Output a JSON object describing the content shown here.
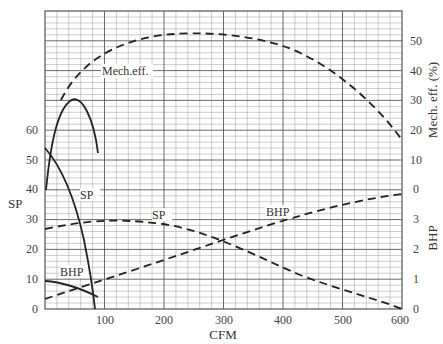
{
  "chart_data": {
    "type": "line",
    "title": "",
    "xlabel": "CFM",
    "ylabel_left": "SP",
    "ylabel_right_upper": "Mech. eff. (%)",
    "ylabel_right_lower": "BHP",
    "xlim": [
      0,
      600
    ],
    "ylim_left": [
      0,
      100
    ],
    "grid": true,
    "x_ticks": [
      "100",
      "200",
      "300",
      "400",
      "500",
      "600"
    ],
    "y_ticks_left": [
      "0",
      "10",
      "20",
      "30",
      "40",
      "50",
      "60"
    ],
    "y_ticks_right_mech_eff": [
      "0",
      "10",
      "20",
      "30",
      "40",
      "50"
    ],
    "y_ticks_right_bhp": [
      "0",
      "1",
      "2",
      "3"
    ],
    "curve_labels": {
      "mech_eff": "Mech.eff.",
      "sp_small": "SP",
      "sp_large": "SP",
      "bhp_small": "BHP",
      "bhp_large": "BHP"
    },
    "series": [
      {
        "name": "Mech.eff. (small fan, solid)",
        "style": "solid",
        "axis": "mech_eff_pct",
        "x": [
          2,
          15,
          30,
          45,
          60,
          75,
          90
        ],
        "y": [
          40,
          58,
          66,
          69,
          67,
          61,
          52
        ]
      },
      {
        "name": "SP (small fan, solid)",
        "style": "solid",
        "axis": "SP",
        "x": [
          0,
          25,
          50,
          70,
          80,
          88,
          92
        ],
        "y": [
          54,
          45,
          32,
          18,
          10,
          3,
          0
        ]
      },
      {
        "name": "BHP (small fan, solid)",
        "style": "solid",
        "axis": "BHP",
        "x": [
          0,
          25,
          50,
          75,
          90
        ],
        "y": [
          0.95,
          0.9,
          0.8,
          0.6,
          0.45
        ]
      },
      {
        "name": "Mech.eff. (large fan, dashed)",
        "style": "dashed",
        "axis": "mech_eff_pct",
        "x": [
          28,
          60,
          100,
          150,
          200,
          250,
          300,
          350,
          400,
          450,
          500,
          550,
          600
        ],
        "y": [
          32,
          40,
          46,
          50,
          51.5,
          51.5,
          50,
          47,
          42,
          36,
          29,
          20,
          10
        ]
      },
      {
        "name": "SP (large fan, dashed)",
        "style": "dashed",
        "axis": "SP",
        "x": [
          0,
          50,
          100,
          150,
          200,
          250,
          300,
          350,
          400,
          450,
          500,
          550,
          600
        ],
        "y": [
          27,
          29,
          29.5,
          29,
          27.5,
          25,
          22.5,
          19.5,
          16,
          12,
          8.5,
          4,
          0
        ]
      },
      {
        "name": "BHP (large fan, dashed)",
        "style": "dashed",
        "axis": "BHP",
        "x": [
          0,
          100,
          200,
          300,
          400,
          500,
          600
        ],
        "y": [
          0.35,
          1.05,
          1.6,
          2.3,
          2.95,
          3.45,
          3.85
        ]
      }
    ]
  }
}
